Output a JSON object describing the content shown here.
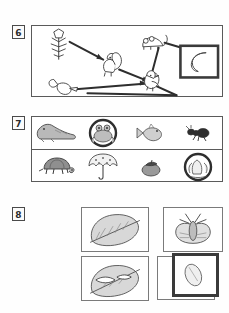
{
  "page": {
    "background_color": "#fefefe",
    "ink_color": "#333333",
    "highlight_color": "#3a3a3a"
  },
  "items": [
    {
      "number": "6",
      "name": "food-web-diagram",
      "type": "diagram",
      "nodes": [
        {
          "id": "flower-plant",
          "icon": "flower-plant-icon",
          "label": "flower plant"
        },
        {
          "id": "squirrel",
          "icon": "squirrel-icon",
          "label": "squirrel"
        },
        {
          "id": "mouse",
          "icon": "mouse-icon",
          "label": "mouse"
        },
        {
          "id": "acorn-nut",
          "icon": "acorn-nut-icon",
          "label": "acorn"
        },
        {
          "id": "bird",
          "icon": "bird-icon",
          "label": "bird"
        },
        {
          "id": "crescent-moon",
          "icon": "crescent-moon-icon",
          "label": "crescent moon",
          "boxed": true
        }
      ],
      "arrows": [
        {
          "from": "flower-plant",
          "to": "squirrel"
        },
        {
          "from": "squirrel",
          "to": "bird"
        },
        {
          "from": "mouse",
          "to": "crescent-moon"
        },
        {
          "from": "mouse",
          "to": "bird"
        },
        {
          "from": "acorn-nut",
          "to": "bird"
        },
        {
          "from": "bird",
          "to": "crescent-moon"
        }
      ]
    },
    {
      "number": "7",
      "name": "animal-picture-grid",
      "type": "grid",
      "rows": [
        {
          "name": "grid-row-top",
          "cells": [
            {
              "icon": "seal-icon",
              "label": "seal",
              "circled": false
            },
            {
              "icon": "frog-icon",
              "label": "frog",
              "circled": true
            },
            {
              "icon": "fish-icon",
              "label": "fish",
              "circled": false
            },
            {
              "icon": "ant-icon",
              "label": "ant",
              "circled": false
            }
          ]
        },
        {
          "name": "grid-row-bottom",
          "cells": [
            {
              "icon": "turtle-icon",
              "label": "turtle",
              "circled": false
            },
            {
              "icon": "umbrella-icon",
              "label": "umbrella",
              "circled": false
            },
            {
              "icon": "berry-icon",
              "label": "berry",
              "circled": false
            },
            {
              "icon": "leaf-buds-icon",
              "label": "buds",
              "circled": true
            }
          ]
        }
      ]
    },
    {
      "number": "8",
      "name": "life-cycle-picture-boxes",
      "type": "boxes",
      "boxes": [
        {
          "id": "box-leaf-whole",
          "icon": "whole-leaf-icon",
          "label": "whole leaf",
          "highlight": false
        },
        {
          "id": "box-moth",
          "icon": "moth-icon",
          "label": "moth",
          "highlight": false
        },
        {
          "id": "box-leaf-eaten",
          "icon": "eaten-leaf-icon",
          "label": "chewed leaf",
          "highlight": false
        },
        {
          "id": "box-cocoon-outer",
          "icon": "empty-box-icon",
          "label": "blank",
          "highlight": false
        },
        {
          "id": "box-cocoon-inner",
          "icon": "cocoon-icon",
          "label": "cocoon",
          "highlight": true
        }
      ]
    }
  ]
}
